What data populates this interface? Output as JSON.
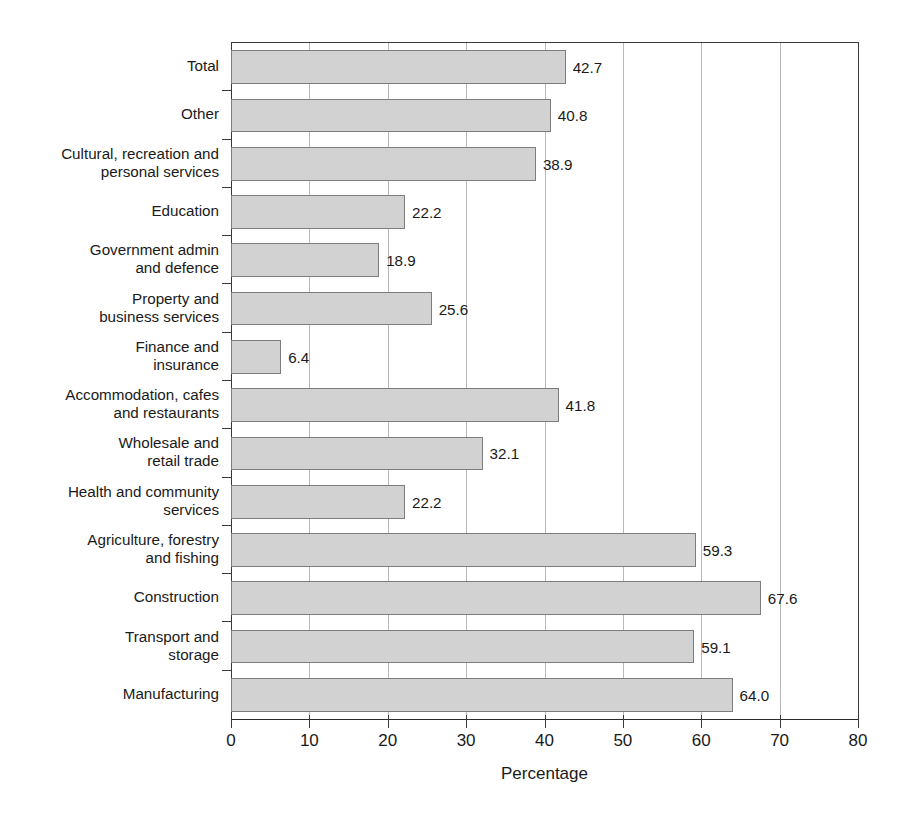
{
  "page": {
    "bleed_text": "",
    "background": "#ffffff"
  },
  "chart_data": {
    "type": "bar",
    "orientation": "horizontal",
    "title": "",
    "xlabel": "Percentage",
    "ylabel": "",
    "xlim": [
      0,
      80
    ],
    "xticks": [
      0,
      10,
      20,
      30,
      40,
      50,
      60,
      70,
      80
    ],
    "xtick_labels": [
      "0",
      "10",
      "20",
      "30",
      "40",
      "50",
      "60",
      "70",
      "80"
    ],
    "grid": "vertical",
    "legend": "none",
    "bar_color": "#d2d2d2",
    "bar_border_color": "#7d7d7d",
    "axis_color": "#3a3a3a",
    "gridline_color": "#b9b9b9",
    "categories": [
      "Total",
      "Other",
      "Cultural, recreation and\npersonal services",
      "Education",
      "Government admin\nand defence",
      "Property and\nbusiness services",
      "Finance and\ninsurance",
      "Accommodation, cafes\nand restaurants",
      "Wholesale and\nretail trade",
      "Health and community\nservices",
      "Agriculture, forestry\nand fishing",
      "Construction",
      "Transport and\nstorage",
      "Manufacturing"
    ],
    "values": [
      42.7,
      40.8,
      38.9,
      22.2,
      18.9,
      25.6,
      6.4,
      41.8,
      32.1,
      22.2,
      59.3,
      67.6,
      59.1,
      64.0
    ],
    "value_labels": [
      "42.7",
      "40.8",
      "38.9",
      "22.2",
      "18.9",
      "25.6",
      "6.4",
      "41.8",
      "32.1",
      "22.2",
      "59.3",
      "67.6",
      "59.1",
      "64.0"
    ]
  }
}
